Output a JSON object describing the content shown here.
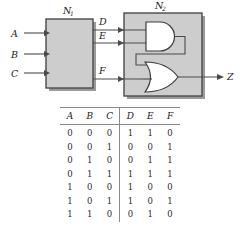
{
  "figure": {
    "block_n1": {
      "label": "N",
      "subscript": "1"
    },
    "block_n2": {
      "label": "N",
      "subscript": "2"
    },
    "inputs": [
      {
        "name": "A"
      },
      {
        "name": "B"
      },
      {
        "name": "C"
      }
    ],
    "internal_signals": [
      {
        "name": "D"
      },
      {
        "name": "E"
      },
      {
        "name": "F"
      }
    ],
    "output": {
      "name": "Z"
    },
    "gates": [
      {
        "type": "and-gate",
        "inputs": [
          "D",
          "E"
        ]
      },
      {
        "type": "or-gate",
        "inputs": [
          "and-gate-output",
          "F"
        ]
      }
    ],
    "colors": {
      "block_fill": "#cdcdcd",
      "block_border": "#4a4a4a",
      "gate_fill": "#ffffff",
      "gate_border": "#3c3c3c",
      "wire": "#4a4a4a",
      "shadow": "#9b9b9b"
    }
  },
  "truth_table": {
    "headers": [
      "A",
      "B",
      "C",
      "D",
      "E",
      "F"
    ],
    "divider_after_column": 3,
    "rows": [
      [
        "0",
        "0",
        "0",
        "1",
        "1",
        "0"
      ],
      [
        "0",
        "0",
        "1",
        "0",
        "0",
        "1"
      ],
      [
        "0",
        "1",
        "0",
        "0",
        "1",
        "1"
      ],
      [
        "0",
        "1",
        "1",
        "1",
        "1",
        "1"
      ],
      [
        "1",
        "0",
        "0",
        "1",
        "0",
        "0"
      ],
      [
        "1",
        "0",
        "1",
        "1",
        "0",
        "1"
      ],
      [
        "1",
        "1",
        "0",
        "0",
        "1",
        "0"
      ]
    ]
  }
}
